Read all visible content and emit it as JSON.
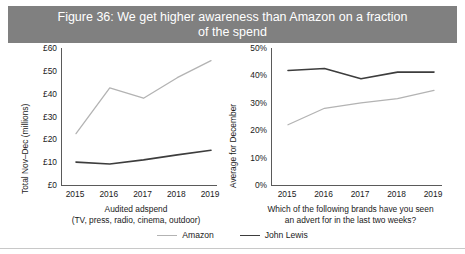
{
  "figure": {
    "title_line1": "Figure 36: We get higher awareness than Amazon on a fraction",
    "title_line2": "of the spend",
    "title_bar_color": "#808080",
    "title_text_color": "#ffffff"
  },
  "legend": {
    "position": "bottom-center",
    "items": [
      {
        "label": "Amazon",
        "color": "#b3b3b3"
      },
      {
        "label": "John Lewis",
        "color": "#3d3d3d"
      }
    ]
  },
  "chart_data": [
    {
      "type": "line",
      "id": "adspend",
      "title": "",
      "xlabel_line1": "Audited adspend",
      "xlabel_line2": "(TV, press, radio, cinema, outdoor)",
      "ylabel": "Total Nov–Dec (millions)",
      "x": [
        "2015",
        "2016",
        "2017",
        "2018",
        "2019"
      ],
      "categories": [
        "2015",
        "2016",
        "2017",
        "2018",
        "2019"
      ],
      "yticks": [
        "£0",
        "£10",
        "£20",
        "£30",
        "£40",
        "£50",
        "£60"
      ],
      "ytick_values": [
        0,
        10,
        20,
        30,
        40,
        50,
        60
      ],
      "ylim": [
        0,
        60
      ],
      "grid": false,
      "series": [
        {
          "name": "Amazon",
          "color": "#b3b3b3",
          "values": [
            22.5,
            42.5,
            38.0,
            47.0,
            54.5
          ]
        },
        {
          "name": "John Lewis",
          "color": "#3d3d3d",
          "values": [
            10.0,
            9.2,
            11.0,
            13.2,
            15.2
          ]
        }
      ]
    },
    {
      "type": "line",
      "id": "awareness",
      "title": "",
      "xlabel_line1": "Which of the following brands have you seen",
      "xlabel_line2": "an advert for in the last two weeks?",
      "ylabel": "Average for December",
      "x": [
        "2015",
        "2016",
        "2017",
        "2018",
        "2019"
      ],
      "categories": [
        "2015",
        "2016",
        "2017",
        "2018",
        "2019"
      ],
      "yticks": [
        "0%",
        "10%",
        "20%",
        "30%",
        "40%",
        "50%"
      ],
      "ytick_values": [
        0,
        10,
        20,
        30,
        40,
        50
      ],
      "ylim": [
        0,
        50
      ],
      "grid": false,
      "series": [
        {
          "name": "Amazon",
          "color": "#b3b3b3",
          "values": [
            22.0,
            28.0,
            30.0,
            31.5,
            34.5
          ]
        },
        {
          "name": "John Lewis",
          "color": "#3d3d3d",
          "values": [
            41.8,
            42.5,
            38.8,
            41.2,
            41.2
          ]
        }
      ]
    }
  ]
}
